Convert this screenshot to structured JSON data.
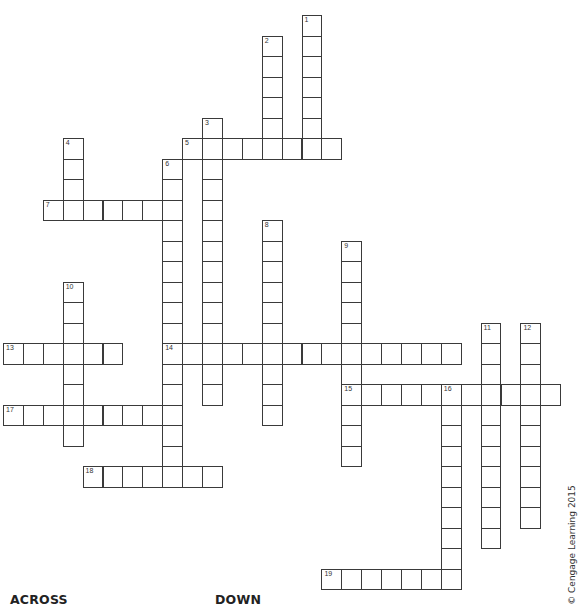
{
  "puzzle": {
    "grid_origin": {
      "x": 3,
      "y": 15
    },
    "cell_size": {
      "w": 19.9,
      "h": 20.5
    },
    "entries": [
      {
        "number": "1",
        "direction": "down",
        "row": 0,
        "col": 15,
        "length": 7
      },
      {
        "number": "2",
        "direction": "down",
        "row": 1,
        "col": 13,
        "length": 6
      },
      {
        "number": "3",
        "direction": "down",
        "row": 5,
        "col": 10,
        "length": 14
      },
      {
        "number": "4",
        "direction": "down",
        "row": 6,
        "col": 3,
        "length": 4
      },
      {
        "number": "5",
        "direction": "across",
        "row": 6,
        "col": 9,
        "length": 8
      },
      {
        "number": "6",
        "direction": "down",
        "row": 7,
        "col": 8,
        "length": 16
      },
      {
        "number": "7",
        "direction": "across",
        "row": 9,
        "col": 2,
        "length": 7
      },
      {
        "number": "8",
        "direction": "down",
        "row": 10,
        "col": 13,
        "length": 10
      },
      {
        "number": "9",
        "direction": "down",
        "row": 11,
        "col": 17,
        "length": 11
      },
      {
        "number": "10",
        "direction": "down",
        "row": 13,
        "col": 3,
        "length": 8
      },
      {
        "number": "11",
        "direction": "down",
        "row": 15,
        "col": 24,
        "length": 11
      },
      {
        "number": "12",
        "direction": "down",
        "row": 15,
        "col": 26,
        "length": 10
      },
      {
        "number": "13",
        "direction": "across",
        "row": 16,
        "col": 0,
        "length": 6
      },
      {
        "number": "14",
        "direction": "across",
        "row": 16,
        "col": 8,
        "length": 15
      },
      {
        "number": "15",
        "direction": "across",
        "row": 18,
        "col": 17,
        "length": 11
      },
      {
        "number": "16",
        "direction": "down",
        "row": 18,
        "col": 22,
        "length": 10
      },
      {
        "number": "17",
        "direction": "across",
        "row": 19,
        "col": 0,
        "length": 9
      },
      {
        "number": "18",
        "direction": "across",
        "row": 22,
        "col": 4,
        "length": 7
      },
      {
        "number": "19",
        "direction": "across",
        "row": 27,
        "col": 16,
        "length": 7
      }
    ]
  },
  "headings": {
    "across": "ACROSS",
    "down": "DOWN"
  },
  "copyright": "© Cengage Learning 2015"
}
